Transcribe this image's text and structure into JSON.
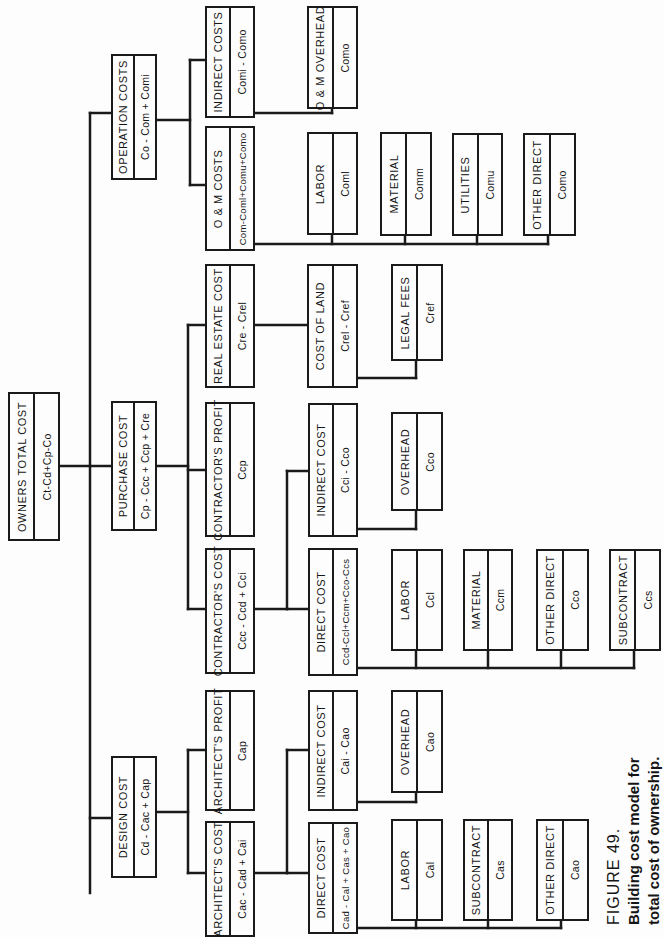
{
  "figure": {
    "number_label": "FIGURE 49.",
    "caption_line1": "Building cost model for",
    "caption_line2": "total cost of ownership."
  },
  "nodes": {
    "owners_total": {
      "title": "OWNERS TOTAL COST",
      "formula": "Ct-Cd+Cp-Co"
    },
    "operation": {
      "title": "OPERATION COSTS",
      "formula": "Co - Com + Comi"
    },
    "purchase": {
      "title": "PURCHASE COST",
      "formula": "Cp - Ccc + Ccp + Cre"
    },
    "design": {
      "title": "DESIGN COST",
      "formula": "Cd - Cac + Cap"
    },
    "op_indirect": {
      "title": "INDIRECT COSTS",
      "formula": "Comi - Como"
    },
    "om_costs": {
      "title": "O & M COSTS",
      "formula": "Com-Coml+Comu+Como"
    },
    "om_overhead": {
      "title": "O & M OVERHEAD",
      "formula": "Como"
    },
    "om_labor": {
      "title": "LABOR",
      "formula": "Coml"
    },
    "om_material": {
      "title": "MATERIAL",
      "formula": "Comm"
    },
    "om_utilities": {
      "title": "UTILITIES",
      "formula": "Comu"
    },
    "om_other": {
      "title": "OTHER DIRECT",
      "formula": "Como"
    },
    "real_estate": {
      "title": "REAL ESTATE COST",
      "formula": "Cre - Crel"
    },
    "cost_of_land": {
      "title": "COST OF LAND",
      "formula": "Crel - Cref"
    },
    "legal_fees": {
      "title": "LEGAL FEES",
      "formula": "Cref"
    },
    "contractor_profit": {
      "title": "CONTRACTOR'S PROFIT",
      "formula": "Ccp"
    },
    "contractor_cost": {
      "title": "CONTRACTOR'S COST",
      "formula": "Ccc - Ccd + Cci"
    },
    "c_indirect": {
      "title": "INDIRECT COST",
      "formula": "Cci - Cco"
    },
    "c_overhead": {
      "title": "OVERHEAD",
      "formula": "Cco"
    },
    "c_direct": {
      "title": "DIRECT COST",
      "formula": "Ccd-Ccl+Ccm+Cco-Ccs"
    },
    "c_labor": {
      "title": "LABOR",
      "formula": "Ccl"
    },
    "c_material": {
      "title": "MATERIAL",
      "formula": "Ccm"
    },
    "c_other": {
      "title": "OTHER DIRECT",
      "formula": "Cco"
    },
    "c_subcontract": {
      "title": "SUBCONTRACT",
      "formula": "Ccs"
    },
    "architect_profit": {
      "title": "ARCHITECT'S PROFIT",
      "formula": "Cap"
    },
    "architect_cost": {
      "title": "ARCHITECT'S COST",
      "formula": "Cac - Cad + Cai"
    },
    "a_indirect": {
      "title": "INDIRECT COST",
      "formula": "Cai - Cao"
    },
    "a_overhead": {
      "title": "OVERHEAD",
      "formula": "Cao"
    },
    "a_direct": {
      "title": "DIRECT COST",
      "formula": "Cad - Cal + Cas + Cao"
    },
    "a_labor": {
      "title": "LABOR",
      "formula": "Cal"
    },
    "a_subcontract": {
      "title": "SUBCONTRACT",
      "formula": "Cas"
    },
    "a_other": {
      "title": "OTHER DIRECT",
      "formula": "Cao"
    }
  }
}
